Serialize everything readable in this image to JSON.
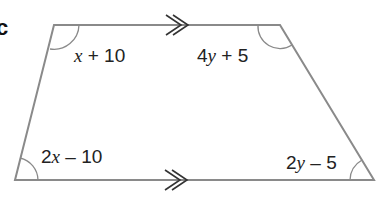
{
  "figure": {
    "part_label": "c",
    "shape": "trapezium",
    "parallel_marker": "double-arrow",
    "angles": {
      "top_left": {
        "coef": "",
        "var": "x",
        "rest": " + 10"
      },
      "top_right": {
        "coef": "4",
        "var": "y",
        "rest": " + 5"
      },
      "bottom_left": {
        "coef": "2",
        "var": "x",
        "rest": " – 10"
      },
      "bottom_right": {
        "coef": "2",
        "var": "y",
        "rest": " – 5"
      }
    },
    "colors": {
      "line": "#8a8a8a",
      "text": "#222222"
    }
  }
}
